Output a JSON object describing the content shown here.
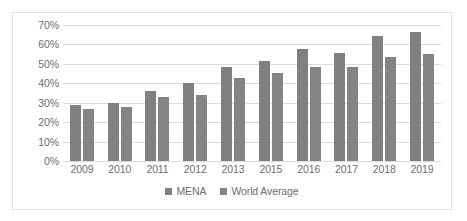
{
  "chart_data": {
    "type": "bar",
    "title": "",
    "subtitle": "",
    "xlabel": "",
    "ylabel": "",
    "categories": [
      "2009",
      "2010",
      "2011",
      "2012",
      "2013",
      "2015",
      "2016",
      "2017",
      "2018",
      "2019"
    ],
    "series": [
      {
        "name": "MENA",
        "color": "#808080",
        "values": [
          29,
          30,
          36,
          40,
          48.5,
          51.5,
          57.5,
          55.5,
          64.5,
          66.5
        ]
      },
      {
        "name": "World Average",
        "color": "#848484",
        "values": [
          27,
          28,
          33,
          34,
          42.5,
          45.5,
          48.5,
          48.5,
          53.5,
          55
        ]
      }
    ],
    "ylim": [
      0,
      70
    ],
    "ytick_values": [
      0,
      10,
      20,
      30,
      40,
      50,
      60,
      70
    ],
    "ytick_labels": [
      "0%",
      "10%",
      "20%",
      "30%",
      "40%",
      "50%",
      "60%",
      "70%"
    ],
    "grid": true,
    "grid_axis": "y",
    "legend_position": "bottom",
    "bar_orientation": "vertical",
    "value_suffix": "%"
  },
  "legend": {
    "items": [
      {
        "label": "MENA",
        "color": "#808080"
      },
      {
        "label": "World Average",
        "color": "#848484"
      }
    ]
  },
  "colors": {
    "series_mena": "#808080",
    "series_world": "#848484",
    "gridline": "#dcdcdc",
    "axis_text": "#6e6e6e",
    "frame_border": "#e2e2e4",
    "background": "#ffffff"
  }
}
